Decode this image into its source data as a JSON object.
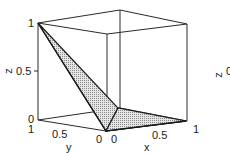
{
  "figure": {
    "type": "3d-surface-plot",
    "axes": {
      "z": {
        "label": "z",
        "ticks": [
          "0",
          "0.5",
          "1"
        ]
      },
      "y": {
        "label": "y",
        "ticks": [
          "1",
          "0.5",
          "0"
        ]
      },
      "x": {
        "label": "x",
        "ticks": [
          "0",
          "0.5",
          "1"
        ]
      }
    },
    "side_label": {
      "axis": "z",
      "tick": "0"
    },
    "colors": {
      "line": "#2a2a2a",
      "fill": "#bdbdbd",
      "background": "#ffffff"
    }
  }
}
